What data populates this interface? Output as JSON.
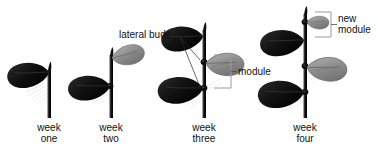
{
  "figure": {
    "background_color": "#ffffff",
    "width": 378,
    "height": 160
  },
  "colors": {
    "mature_leaf": "#141414",
    "young_leaf": "#8f8f8f",
    "young_leaf_light": "#b5b5b5",
    "stem": "#1a1a1a",
    "stem_shade": "#4a4a4a",
    "bracket": "#9a9a9a",
    "leader_line": "#2b2b2b",
    "text": "#111111",
    "shadow": "#d4d4d4"
  },
  "stages": [
    {
      "id": "week-one",
      "caption_line1": "week",
      "caption_line2": "one",
      "leaf_count": 1,
      "module_count": 0
    },
    {
      "id": "week-two",
      "caption_line1": "week",
      "caption_line2": "two",
      "leaf_count": 2,
      "module_count": 1
    },
    {
      "id": "week-three",
      "caption_line1": "week",
      "caption_line2": "three",
      "leaf_count": 3,
      "module_count": 2
    },
    {
      "id": "week-four",
      "caption_line1": "week",
      "caption_line2": "four",
      "leaf_count": 4,
      "module_count": 3
    }
  ],
  "annotations": {
    "lateral_buds": {
      "label": "lateral buds",
      "target_count": 2
    },
    "module": {
      "label": "module"
    },
    "new_module": {
      "label_line1": "new",
      "label_line2": "module"
    }
  }
}
